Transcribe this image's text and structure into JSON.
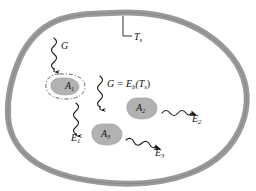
{
  "figure": {
    "colors": {
      "cavity_wall": "#9a9a9a",
      "cavity_wall_edge": "#7d7d7d",
      "cavity_interior": "#ffffff",
      "surface_blob": "#b2b2b2",
      "surface_blob_edge": "#9a9a9a",
      "arrow": "#1a1a1a",
      "text": "#111111",
      "background": "#ffffff"
    },
    "cavity": {
      "name": "isothermal enclosure wall",
      "wall_label": "T",
      "wall_label_sub": "s",
      "wall_label_full": "Ts"
    },
    "irradiation": {
      "incoming_label": "G",
      "relation_label": "G = E",
      "relation_sub": "b",
      "relation_tail": "(T",
      "relation_tail_sub": "s",
      "relation_close": ")",
      "relation_full": "G = Eb(Ts)"
    },
    "surfaces": [
      {
        "id": "A1",
        "label": "A",
        "sub": "1",
        "full": "A1",
        "outline": "dash-dot",
        "emission": "E1"
      },
      {
        "id": "A2",
        "label": "A",
        "sub": "2",
        "full": "A2",
        "outline": "solid",
        "emission": "E2"
      },
      {
        "id": "A3",
        "label": "A",
        "sub": "3",
        "full": "A3",
        "outline": "solid",
        "emission": "E3"
      }
    ],
    "emissions": [
      {
        "id": "E1",
        "label": "E",
        "sub": "1",
        "full": "E1",
        "direction": "down"
      },
      {
        "id": "E2",
        "label": "E",
        "sub": "2",
        "full": "E2",
        "direction": "right"
      },
      {
        "id": "E3",
        "label": "E",
        "sub": "3",
        "full": "E3",
        "direction": "right-down"
      }
    ],
    "arrows": [
      {
        "name": "irradiation-arrow-top",
        "kind": "wavy",
        "direction": "down"
      },
      {
        "name": "irradiation-arrow-center",
        "kind": "wavy",
        "direction": "down"
      },
      {
        "name": "emission-arrow-a1",
        "kind": "wavy",
        "direction": "down"
      },
      {
        "name": "emission-arrow-a2",
        "kind": "wavy",
        "direction": "right"
      },
      {
        "name": "emission-arrow-a3",
        "kind": "wavy",
        "direction": "right-down"
      }
    ]
  }
}
